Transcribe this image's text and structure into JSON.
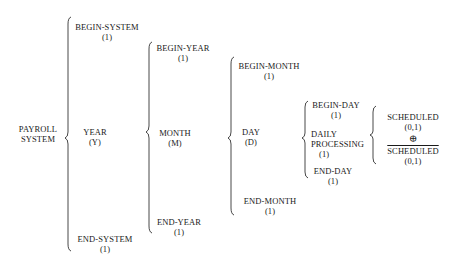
{
  "diagram": {
    "type": "warnier-orr",
    "root": {
      "label": "PAYROLL SYSTEM",
      "lines": [
        "PAYROLL",
        "SYSTEM"
      ]
    },
    "levels": {
      "system": [
        {
          "name": "BEGIN-SYSTEM",
          "rep": "(1)"
        },
        {
          "name": "YEAR",
          "rep": "(Y)"
        },
        {
          "name": "END-SYSTEM",
          "rep": "(1)"
        }
      ],
      "year": [
        {
          "name": "BEGIN-YEAR",
          "rep": "(1)"
        },
        {
          "name": "MONTH",
          "rep": "(M)"
        },
        {
          "name": "END-YEAR",
          "rep": "(1)"
        }
      ],
      "month": [
        {
          "name": "BEGIN-MONTH",
          "rep": "(1)"
        },
        {
          "name": "DAY",
          "rep": "(D)"
        },
        {
          "name": "END-MONTH",
          "rep": "(1)"
        }
      ],
      "day": [
        {
          "name": "BEGIN-DAY",
          "rep": "(1)"
        },
        {
          "name_lines": [
            "DAILY",
            "PROCESSING"
          ],
          "rep": "(1)"
        },
        {
          "name": "END-DAY",
          "rep": "(1)"
        }
      ],
      "daily_processing": [
        {
          "name": "SCHEDULED",
          "rep": "(0,1)"
        },
        {
          "operator": "⊕"
        },
        {
          "name": "SCHEDULED",
          "negated": true,
          "rep": "(0,1)"
        }
      ]
    }
  }
}
